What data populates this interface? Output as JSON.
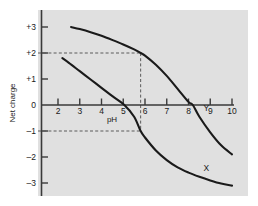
{
  "chart_data": {
    "type": "line",
    "title": "",
    "xlabel": "pH",
    "ylabel": "Net charge",
    "xlim": [
      1.4,
      10.4
    ],
    "ylim": [
      -3.6,
      3.6
    ],
    "xticks": [
      "2",
      "3",
      "4",
      "5",
      "6",
      "7",
      "8",
      "9",
      "10"
    ],
    "xtick_values": [
      2,
      3,
      4,
      5,
      6,
      7,
      8,
      9,
      10
    ],
    "yticks": [
      "+3",
      "+2",
      "+1",
      "0",
      "-1",
      "-2",
      "-3"
    ],
    "ytick_values": [
      3,
      2,
      1,
      0,
      -1,
      -2,
      -3
    ],
    "grid": false,
    "legend": "inline-curve-labels",
    "series": [
      {
        "name": "Y",
        "label": "Y",
        "color": "#1a1a1a",
        "isoelectric_point": 8.2,
        "x": [
          2.6,
          3.0,
          3.5,
          4.0,
          4.5,
          5.0,
          5.5,
          5.8,
          6.0,
          6.5,
          7.0,
          7.5,
          8.0,
          8.2,
          8.5,
          9.0,
          9.5,
          10.0
        ],
        "y": [
          3.0,
          2.92,
          2.8,
          2.66,
          2.5,
          2.33,
          2.14,
          2.0,
          1.9,
          1.55,
          1.12,
          0.62,
          0.12,
          0.0,
          -0.45,
          -1.05,
          -1.55,
          -1.9
        ]
      },
      {
        "name": "X",
        "label": "X",
        "color": "#1a1a1a",
        "isoelectric_point": 5.05,
        "x": [
          2.2,
          2.5,
          3.0,
          3.5,
          4.0,
          4.5,
          5.05,
          5.5,
          5.8,
          6.0,
          6.5,
          7.0,
          7.5,
          8.0,
          8.5,
          9.0,
          9.5,
          10.0
        ],
        "y": [
          1.8,
          1.62,
          1.3,
          0.98,
          0.66,
          0.34,
          0.0,
          -0.45,
          -1.0,
          -1.25,
          -1.75,
          -2.12,
          -2.4,
          -2.6,
          -2.76,
          -2.9,
          -3.02,
          -3.1
        ]
      }
    ],
    "annotations": [
      {
        "name": "charge-plus-2-guide",
        "type": "horizontal-dashed",
        "value": 2,
        "from_x": 1.4,
        "to_x": 5.8
      },
      {
        "name": "charge-minus-1-guide",
        "type": "horizontal-dashed",
        "value": -1,
        "from_x": 1.4,
        "to_x": 5.8
      },
      {
        "name": "ph-5-8-guide",
        "type": "vertical-dashed",
        "value": 5.8,
        "from_y": -1,
        "to_y": 2
      }
    ]
  },
  "colors": {
    "plot_background": "#e0e0e0",
    "page_background": "#ffffff",
    "axis": "#3a3a3a",
    "curve": "#1a1a1a",
    "dashed_guide": "#5a5a5a",
    "text": "#1a1a1a"
  }
}
